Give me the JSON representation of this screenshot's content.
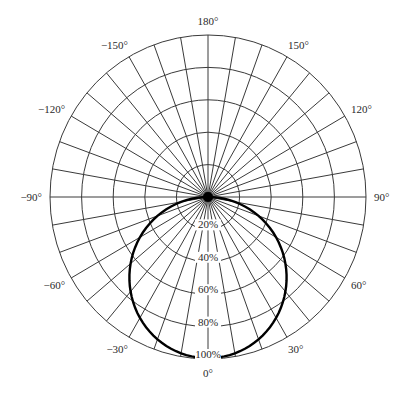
{
  "chart_data": {
    "type": "polar",
    "title": "",
    "angular_unit": "degrees",
    "angle_zero_direction": "down",
    "angular_ticks": [
      0,
      30,
      60,
      90,
      120,
      150,
      180,
      -150,
      -120,
      -90,
      -60,
      -30
    ],
    "angular_tick_labels": [
      "0°",
      "30°",
      "60°",
      "90°",
      "120°",
      "150°",
      "180°",
      "-150°",
      "-120°",
      "-90°",
      "-60°",
      "-30°"
    ],
    "radial_gridline_step_degrees": 10,
    "radial_ticks": [
      20,
      40,
      60,
      80,
      100
    ],
    "radial_tick_labels": [
      "20%",
      "40%",
      "60%",
      "80%",
      "100%"
    ],
    "radial_range": [
      0,
      100
    ],
    "grid": true,
    "series": [
      {
        "name": "Intensity distribution",
        "description": "Circular pattern r = 100·cos(θ), max 100% at 0°, 0% at ±90°",
        "theta": [
          -90,
          -80,
          -70,
          -60,
          -50,
          -40,
          -30,
          -20,
          -10,
          0,
          10,
          20,
          30,
          40,
          50,
          60,
          70,
          80,
          90
        ],
        "r": [
          0,
          17,
          34,
          50,
          64,
          77,
          87,
          94,
          98,
          100,
          98,
          94,
          87,
          77,
          64,
          50,
          34,
          17,
          0
        ]
      }
    ],
    "center_marker": "filled-dot"
  },
  "geometry": {
    "cx": 208,
    "cy": 197,
    "rx": 158,
    "ry": 162
  }
}
